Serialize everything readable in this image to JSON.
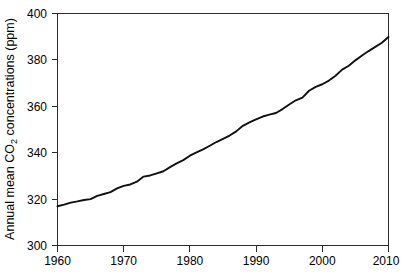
{
  "chart_data": {
    "type": "line",
    "title": "",
    "xlabel": "",
    "ylabel": "Annual mean CO2 concentrations (ppm)",
    "ylabel_parts": {
      "before": "Annual mean CO",
      "sub": "2",
      "after": " concentrations (ppm)"
    },
    "xlim": [
      1960,
      2010
    ],
    "ylim": [
      300,
      400
    ],
    "xticks": [
      1960,
      1970,
      1980,
      1990,
      2000,
      2010
    ],
    "yticks": [
      300,
      320,
      340,
      360,
      380,
      400
    ],
    "grid": false,
    "legend": null,
    "line_color": "#101010",
    "axis_color": "#2b2b2b",
    "background_color": "#ffffff",
    "series": [
      {
        "name": "Annual mean CO2",
        "x": [
          1960,
          1961,
          1962,
          1963,
          1964,
          1965,
          1966,
          1967,
          1968,
          1969,
          1970,
          1971,
          1972,
          1973,
          1974,
          1975,
          1976,
          1977,
          1978,
          1979,
          1980,
          1981,
          1982,
          1983,
          1984,
          1985,
          1986,
          1987,
          1988,
          1989,
          1990,
          1991,
          1992,
          1993,
          1994,
          1995,
          1996,
          1997,
          1998,
          1999,
          2000,
          2001,
          2002,
          2003,
          2004,
          2005,
          2006,
          2007,
          2008,
          2009,
          2010
        ],
        "values": [
          316.9,
          317.6,
          318.5,
          319.0,
          319.6,
          320.0,
          321.4,
          322.2,
          323.0,
          324.6,
          325.7,
          326.3,
          327.5,
          329.7,
          330.2,
          331.1,
          332.0,
          333.8,
          335.4,
          336.8,
          338.7,
          340.1,
          341.4,
          343.0,
          344.6,
          346.0,
          347.4,
          349.2,
          351.6,
          353.1,
          354.4,
          355.6,
          356.4,
          357.1,
          358.8,
          360.8,
          362.6,
          363.7,
          366.7,
          368.4,
          369.5,
          371.1,
          373.2,
          375.8,
          377.5,
          379.8,
          381.9,
          383.8,
          385.6,
          387.4,
          389.9
        ]
      }
    ]
  },
  "axis": {
    "y_tick_labels": [
      "400",
      "380",
      "360",
      "340",
      "320",
      "300"
    ],
    "x_tick_labels": [
      "1960",
      "1970",
      "1980",
      "1990",
      "2000",
      "2010"
    ]
  }
}
